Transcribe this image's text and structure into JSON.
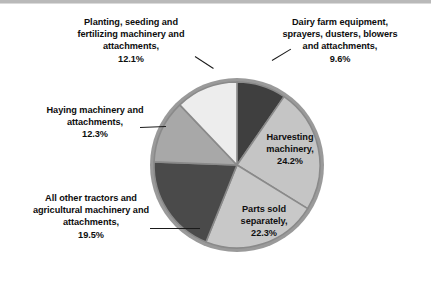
{
  "chart_data": {
    "type": "pie",
    "title": "",
    "legend_position": "labels-on-slices",
    "units": "percent",
    "categories": [
      "Dairy farm equipment, sprayers, dusters, blowers and attachments",
      "Harvesting machinery",
      "Parts sold separately",
      "All other tractors and agricultural machinery and attachments",
      "Haying machinery and attachments",
      "Planting, seeding and fertilizing machinery and attachments"
    ],
    "values": [
      9.6,
      24.2,
      22.3,
      19.5,
      12.3,
      12.1
    ],
    "colors": [
      "#3f3f3f",
      "#c5c5c5",
      "#c8c8c8",
      "#4a4a4a",
      "#a8a8a8",
      "#ededed"
    ],
    "start_angle_deg": 0,
    "direction": "clockwise"
  },
  "slices": [
    {
      "id": "dairy",
      "name": "Dairy farm equipment, sprayers, dusters, blowers and attachments",
      "percent": "9.6%",
      "label_text": "Dairy farm equipment,\nsprayers, dusters, blowers\nand attachments,\n9.6%",
      "color": "#3f3f3f",
      "label_placement": "outside"
    },
    {
      "id": "harvesting",
      "name": "Harvesting machinery",
      "percent": "24.2%",
      "label_text": "Harvesting\nmachinery,\n24.2%",
      "color": "#c5c5c5",
      "label_placement": "inside"
    },
    {
      "id": "parts",
      "name": "Parts sold separately",
      "percent": "22.3%",
      "label_text": "Parts sold\nseparately,\n22.3%",
      "color": "#c8c8c8",
      "label_placement": "inside"
    },
    {
      "id": "allother",
      "name": "All other tractors and agricultural machinery and attachments",
      "percent": "19.5%",
      "label_text": "All other tractors and\nagricultural machinery and\nattachments,\n19.5%",
      "color": "#4a4a4a",
      "label_placement": "outside"
    },
    {
      "id": "haying",
      "name": "Haying machinery and attachments",
      "percent": "12.3%",
      "label_text": "Haying machinery and\nattachments,\n12.3%",
      "color": "#a8a8a8",
      "label_placement": "outside"
    },
    {
      "id": "planting",
      "name": "Planting, seeding and fertilizing machinery and attachments",
      "percent": "12.1%",
      "label_text": "Planting, seeding and\nfertilizing machinery and\nattachments,\n12.1%",
      "color": "#ededed",
      "label_placement": "outside"
    }
  ],
  "style": {
    "slice_border": "#8a8a8a",
    "pie_rim": "#9a9a9a",
    "background": "#ffffff",
    "text_color": "#0d0d0d"
  }
}
